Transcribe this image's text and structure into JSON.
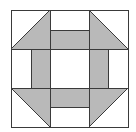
{
  "diagram": {
    "title": "Churn Dash quilt block",
    "grid": {
      "rows": 3,
      "cols": 3
    },
    "colors": {
      "background": "#ffffff",
      "fill_dark": "#b9b9b9",
      "fill_light": "#ffffff",
      "stroke": "#3a3a3a"
    },
    "corners": [
      {
        "position": "top-left",
        "shaded_half": "bottom-right"
      },
      {
        "position": "top-right",
        "shaded_half": "bottom-left"
      },
      {
        "position": "bottom-left",
        "shaded_half": "top-right"
      },
      {
        "position": "bottom-right",
        "shaded_half": "top-left"
      }
    ],
    "bars": [
      {
        "position": "top",
        "shaded_half": "bottom"
      },
      {
        "position": "left",
        "shaded_half": "right"
      },
      {
        "position": "right",
        "shaded_half": "left"
      },
      {
        "position": "bottom",
        "shaded_half": "top"
      }
    ],
    "center": {
      "shaded": false
    }
  }
}
